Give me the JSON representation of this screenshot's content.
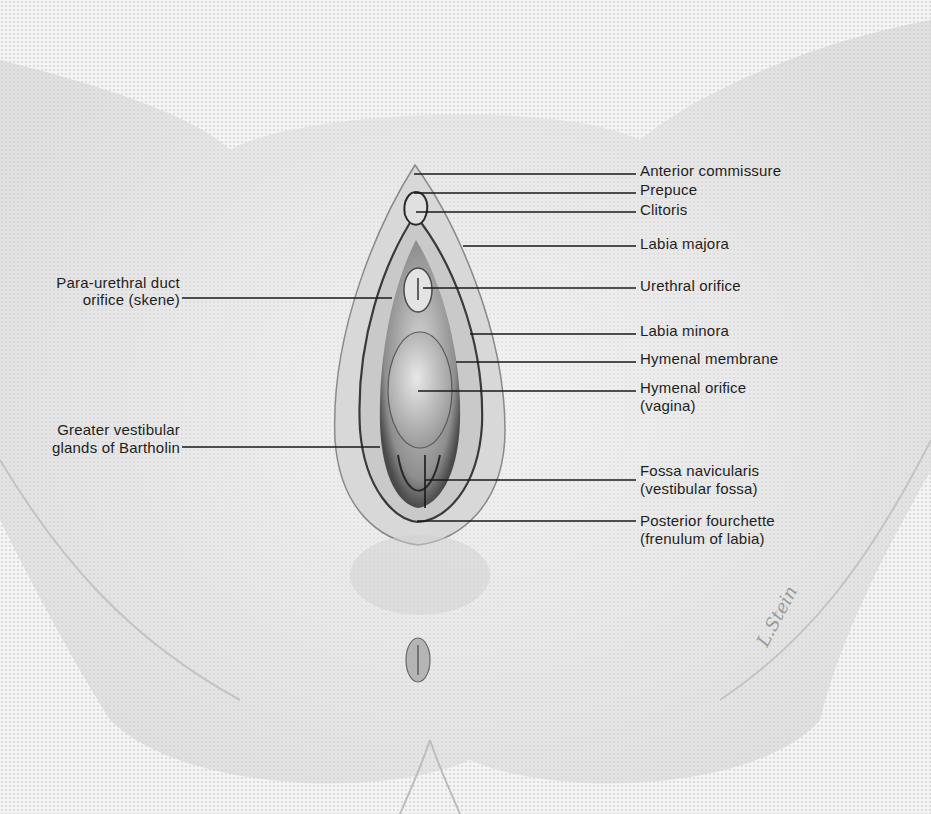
{
  "figure": {
    "type": "anatomical illustration",
    "signature": "L.Stein"
  },
  "labels": {
    "right": [
      {
        "id": "anterior-commissure",
        "lines": [
          "Anterior commissure"
        ],
        "text_x": 640,
        "text_y": 162,
        "line_y": 174,
        "line_from_x": 414
      },
      {
        "id": "prepuce",
        "lines": [
          "Prepuce"
        ],
        "text_x": 640,
        "text_y": 181,
        "line_y": 193,
        "line_from_x": 414
      },
      {
        "id": "clitoris",
        "lines": [
          "Clitoris"
        ],
        "text_x": 640,
        "text_y": 201,
        "line_y": 212,
        "line_from_x": 416
      },
      {
        "id": "labia-majora",
        "lines": [
          "Labia majora"
        ],
        "text_x": 640,
        "text_y": 235,
        "line_y": 246,
        "line_from_x": 463
      },
      {
        "id": "urethral-orifice",
        "lines": [
          "Urethral orifice"
        ],
        "text_x": 640,
        "text_y": 277,
        "line_y": 288,
        "line_from_x": 423
      },
      {
        "id": "labia-minora",
        "lines": [
          "Labia minora"
        ],
        "text_x": 640,
        "text_y": 322,
        "line_y": 334,
        "line_from_x": 470
      },
      {
        "id": "hymenal-membrane",
        "lines": [
          "Hymenal membrane"
        ],
        "text_x": 640,
        "text_y": 350,
        "line_y": 362,
        "line_from_x": 456
      },
      {
        "id": "hymenal-orifice",
        "lines": [
          "Hymenal orifice",
          "(vagina)"
        ],
        "text_x": 640,
        "text_y": 379,
        "line_y": 391,
        "line_from_x": 418
      },
      {
        "id": "fossa-navicularis",
        "lines": [
          "Fossa navicularis",
          "(vestibular fossa)"
        ],
        "text_x": 640,
        "text_y": 462,
        "line_y": 480,
        "line_from_x": 425
      },
      {
        "id": "posterior-fourchette",
        "lines": [
          "Posterior fourchette",
          "(frenulum of labia)"
        ],
        "text_x": 640,
        "text_y": 512,
        "line_y": 521,
        "line_from_x": 417
      }
    ],
    "left": [
      {
        "id": "para-urethral-duct",
        "lines": [
          "Para-urethral duct",
          "orifice (skene)"
        ],
        "text_right_x": 180,
        "text_y": 274,
        "line_y": 298,
        "line_to_x": 392
      },
      {
        "id": "bartholin-glands",
        "lines": [
          "Greater vestibular",
          "glands of Bartholin"
        ],
        "text_right_x": 180,
        "text_y": 421,
        "line_y": 447,
        "line_to_x": 380
      }
    ]
  }
}
